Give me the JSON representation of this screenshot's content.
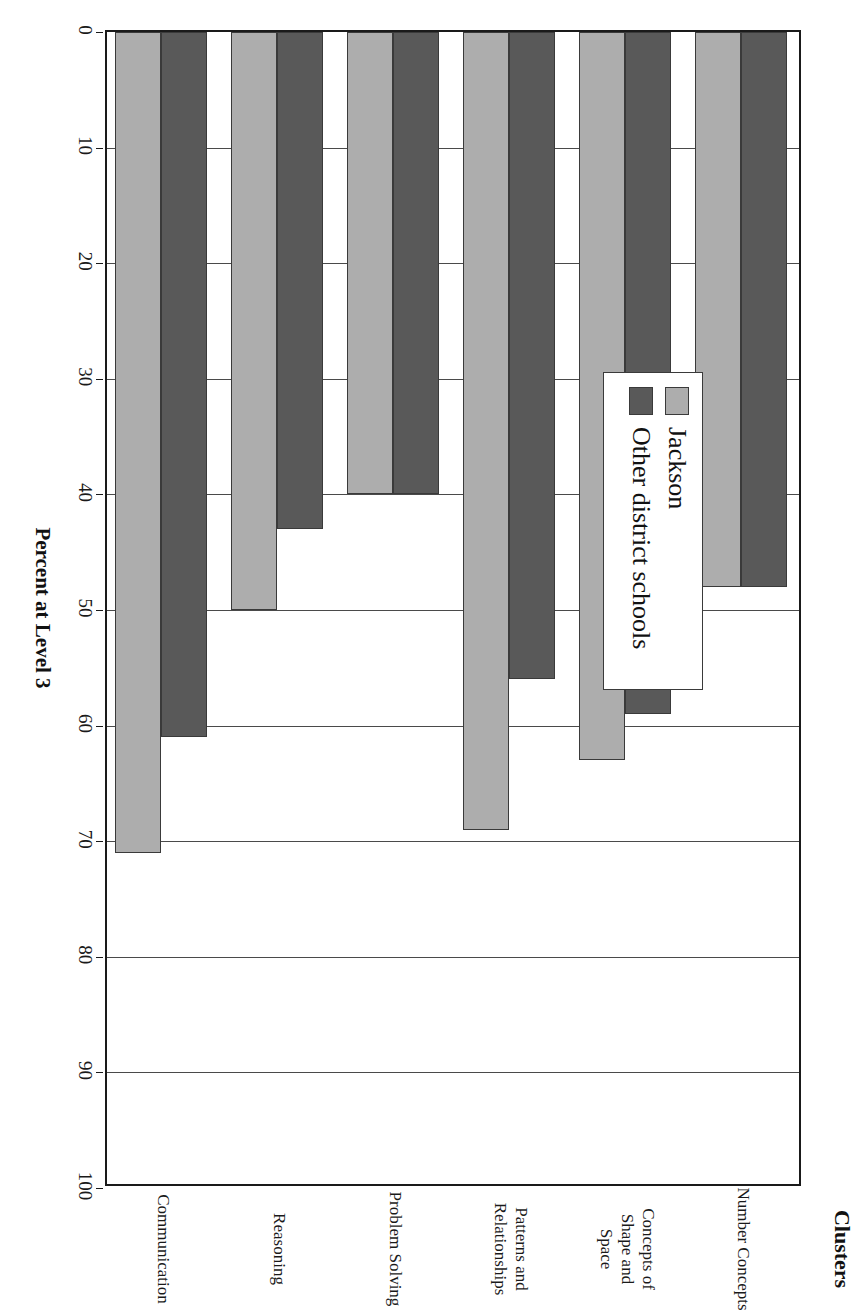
{
  "chart_data": {
    "type": "bar",
    "orientation": "horizontal",
    "title": "",
    "xlabel": "Clusters",
    "ylabel": "Percent at Level 3",
    "ylim": [
      0,
      100
    ],
    "ytick_labels": [
      "0",
      "10",
      "20",
      "30",
      "40",
      "50",
      "60",
      "70",
      "80",
      "90",
      "100"
    ],
    "ytick_values": [
      0,
      10,
      20,
      30,
      40,
      50,
      60,
      70,
      80,
      90,
      100
    ],
    "grid": true,
    "legend_position": "inside-upper-left",
    "categories": [
      "Number Concepts",
      "Concepts of Shape and Space",
      "Patterns and Relationships",
      "Problem Solving",
      "Reasoning",
      "Communication"
    ],
    "category_lines": [
      [
        "Number Concepts"
      ],
      [
        "Concepts of Shape and",
        "Space"
      ],
      [
        "Patterns and",
        "Relationships"
      ],
      [
        "Problem Solving"
      ],
      [
        "Reasoning"
      ],
      [
        "Communication"
      ]
    ],
    "series": [
      {
        "name": "Jackson",
        "color": "#adadad",
        "values": [
          48,
          63,
          69,
          40,
          50,
          71
        ]
      },
      {
        "name": "Other district schools",
        "color": "#595959",
        "values": [
          48,
          59,
          56,
          40,
          43,
          61
        ]
      }
    ]
  },
  "legend": {
    "items": [
      {
        "label": "Jackson",
        "swatch": "light-gray-swatch"
      },
      {
        "label": "Other district schools",
        "swatch": "dark-gray-swatch"
      }
    ]
  },
  "axes": {
    "value_axis_title": "Percent at Level 3",
    "category_axis_title": "Clusters"
  },
  "colors": {
    "series_light": "#adadad",
    "series_dark": "#595959",
    "axis": "#1a1a1a",
    "grid": "#4a4a4a",
    "background": "#ffffff"
  }
}
